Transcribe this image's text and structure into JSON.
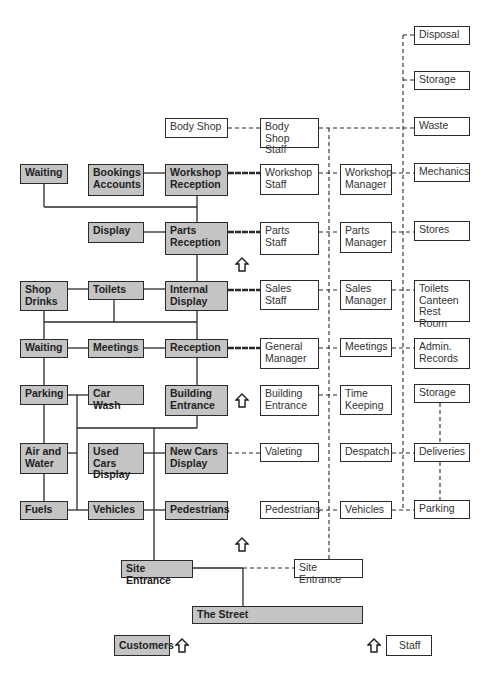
{
  "diagram": {
    "type": "facility-layout-flow",
    "legend": {
      "customers_label": "Customers",
      "staff_label": "Staff"
    },
    "customer_areas": [
      {
        "id": "waiting1",
        "label": "Waiting"
      },
      {
        "id": "bookings",
        "label": "Bookings\nAccounts"
      },
      {
        "id": "workshop_reception",
        "label": "Workshop\nReception"
      },
      {
        "id": "display",
        "label": "Display"
      },
      {
        "id": "parts_reception",
        "label": "Parts\nReception"
      },
      {
        "id": "shop_drinks",
        "label": "Shop\nDrinks"
      },
      {
        "id": "toilets",
        "label": "Toilets"
      },
      {
        "id": "internal_display",
        "label": "Internal\nDisplay"
      },
      {
        "id": "waiting2",
        "label": "Waiting"
      },
      {
        "id": "meetings",
        "label": "Meetings"
      },
      {
        "id": "reception",
        "label": "Reception"
      },
      {
        "id": "parking",
        "label": "Parking"
      },
      {
        "id": "car_wash",
        "label": "Car Wash"
      },
      {
        "id": "building_entrance",
        "label": "Building\nEntrance"
      },
      {
        "id": "air_water",
        "label": "Air and\nWater"
      },
      {
        "id": "used_cars",
        "label": "Used Cars\nDisplay"
      },
      {
        "id": "new_cars",
        "label": "New Cars\nDisplay"
      },
      {
        "id": "fuels",
        "label": "Fuels"
      },
      {
        "id": "vehicles",
        "label": "Vehicles"
      },
      {
        "id": "pedestrians",
        "label": "Pedestrians"
      },
      {
        "id": "site_entrance",
        "label": "Site Entrance"
      },
      {
        "id": "the_street",
        "label": "The Street"
      }
    ],
    "staff_areas": [
      {
        "id": "body_shop",
        "label": "Body Shop"
      },
      {
        "id": "body_shop_staff",
        "label": "Body Shop\nStaff"
      },
      {
        "id": "disposal",
        "label": "Disposal"
      },
      {
        "id": "storage1",
        "label": "Storage"
      },
      {
        "id": "waste",
        "label": "Waste"
      },
      {
        "id": "workshop_staff",
        "label": "Workshop\nStaff"
      },
      {
        "id": "workshop_manager",
        "label": "Workshop\nManager"
      },
      {
        "id": "mechanics",
        "label": "Mechanics"
      },
      {
        "id": "parts_staff",
        "label": "Parts\nStaff"
      },
      {
        "id": "parts_manager",
        "label": "Parts\nManager"
      },
      {
        "id": "stores",
        "label": "Stores"
      },
      {
        "id": "sales_staff",
        "label": "Sales\nStaff"
      },
      {
        "id": "sales_manager",
        "label": "Sales\nManager"
      },
      {
        "id": "toilets_canteen",
        "label": "Toilets\nCanteen\nRest Room"
      },
      {
        "id": "general_manager",
        "label": "General\nManager"
      },
      {
        "id": "staff_meetings",
        "label": "Meetings"
      },
      {
        "id": "admin_records",
        "label": "Admin.\nRecords"
      },
      {
        "id": "staff_building_entrance",
        "label": "Building\nEntrance"
      },
      {
        "id": "time_keeping",
        "label": "Time\nKeeping"
      },
      {
        "id": "storage2",
        "label": "Storage"
      },
      {
        "id": "valeting",
        "label": "Valeting"
      },
      {
        "id": "despatch",
        "label": "Despatch"
      },
      {
        "id": "deliveries",
        "label": "Deliveries"
      },
      {
        "id": "staff_pedestrians",
        "label": "Pedestrians"
      },
      {
        "id": "staff_vehicles",
        "label": "Vehicles"
      },
      {
        "id": "staff_parking",
        "label": "Parking"
      },
      {
        "id": "staff_site_entrance",
        "label": "Site Entrance"
      }
    ],
    "colors": {
      "customer_fill": "#c4c4c4",
      "staff_fill": "#ffffff",
      "line": "#2a2a2a"
    }
  }
}
